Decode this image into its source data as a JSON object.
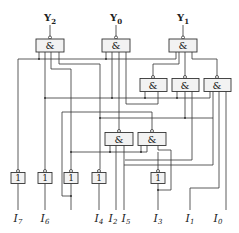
{
  "diagram": {
    "type": "logic-circuit",
    "outputs": [
      {
        "name": "Y",
        "sub": "2"
      },
      {
        "name": "Y",
        "sub": "0"
      },
      {
        "name": "Y",
        "sub": "1"
      }
    ],
    "inputs": [
      {
        "name": "I",
        "sub": "7"
      },
      {
        "name": "I",
        "sub": "6"
      },
      {
        "name": "I",
        "sub": "4"
      },
      {
        "name": "I",
        "sub": "2"
      },
      {
        "name": "I",
        "sub": "5"
      },
      {
        "name": "I",
        "sub": "3"
      },
      {
        "name": "I",
        "sub": "1"
      },
      {
        "name": "I",
        "sub": "0"
      }
    ],
    "gates": {
      "and_symbol": "&",
      "not_symbol": "1",
      "and_gate_count": 8,
      "not_gate_count": 5
    }
  }
}
